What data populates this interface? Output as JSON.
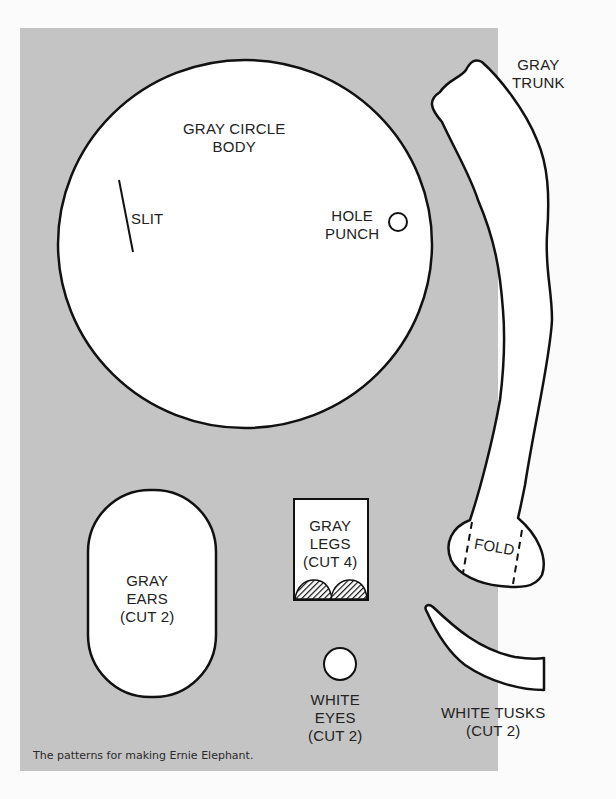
{
  "pieces": {
    "body": {
      "label": "GRAY CIRCLE\nBODY",
      "slit_label": "SLIT",
      "hole_label": "HOLE\nPUNCH"
    },
    "trunk": {
      "label": "GRAY\nTRUNK",
      "fold_label": "FOLD"
    },
    "ears": {
      "label": "GRAY\nEARS\n(CUT 2)"
    },
    "legs": {
      "label": "GRAY\nLEGS\n(CUT 4)"
    },
    "eyes": {
      "label": "WHITE\nEYES\n(CUT 2)"
    },
    "tusks": {
      "label": "WHITE TUSKS\n(CUT 2)"
    }
  },
  "caption": "The patterns for making Ernie Elephant.",
  "colors": {
    "panel": "#c4c4c4",
    "piece_fill": "#ffffff",
    "outline": "#111111"
  }
}
